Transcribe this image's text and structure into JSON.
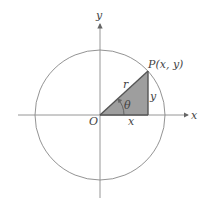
{
  "diagram": {
    "type": "unit-circle-polar-coordinates",
    "colors": {
      "axis": "#8a8a8a",
      "circle": "#777777",
      "triangle_fill": "#9e9e9e",
      "triangle_stroke": "#555555",
      "text": "#444444"
    },
    "labels": {
      "x_axis": "x",
      "y_axis": "y",
      "origin": "O",
      "point": "P(x, y)",
      "radius": "r",
      "angle": "θ",
      "adjacent": "x",
      "opposite": "y"
    }
  }
}
